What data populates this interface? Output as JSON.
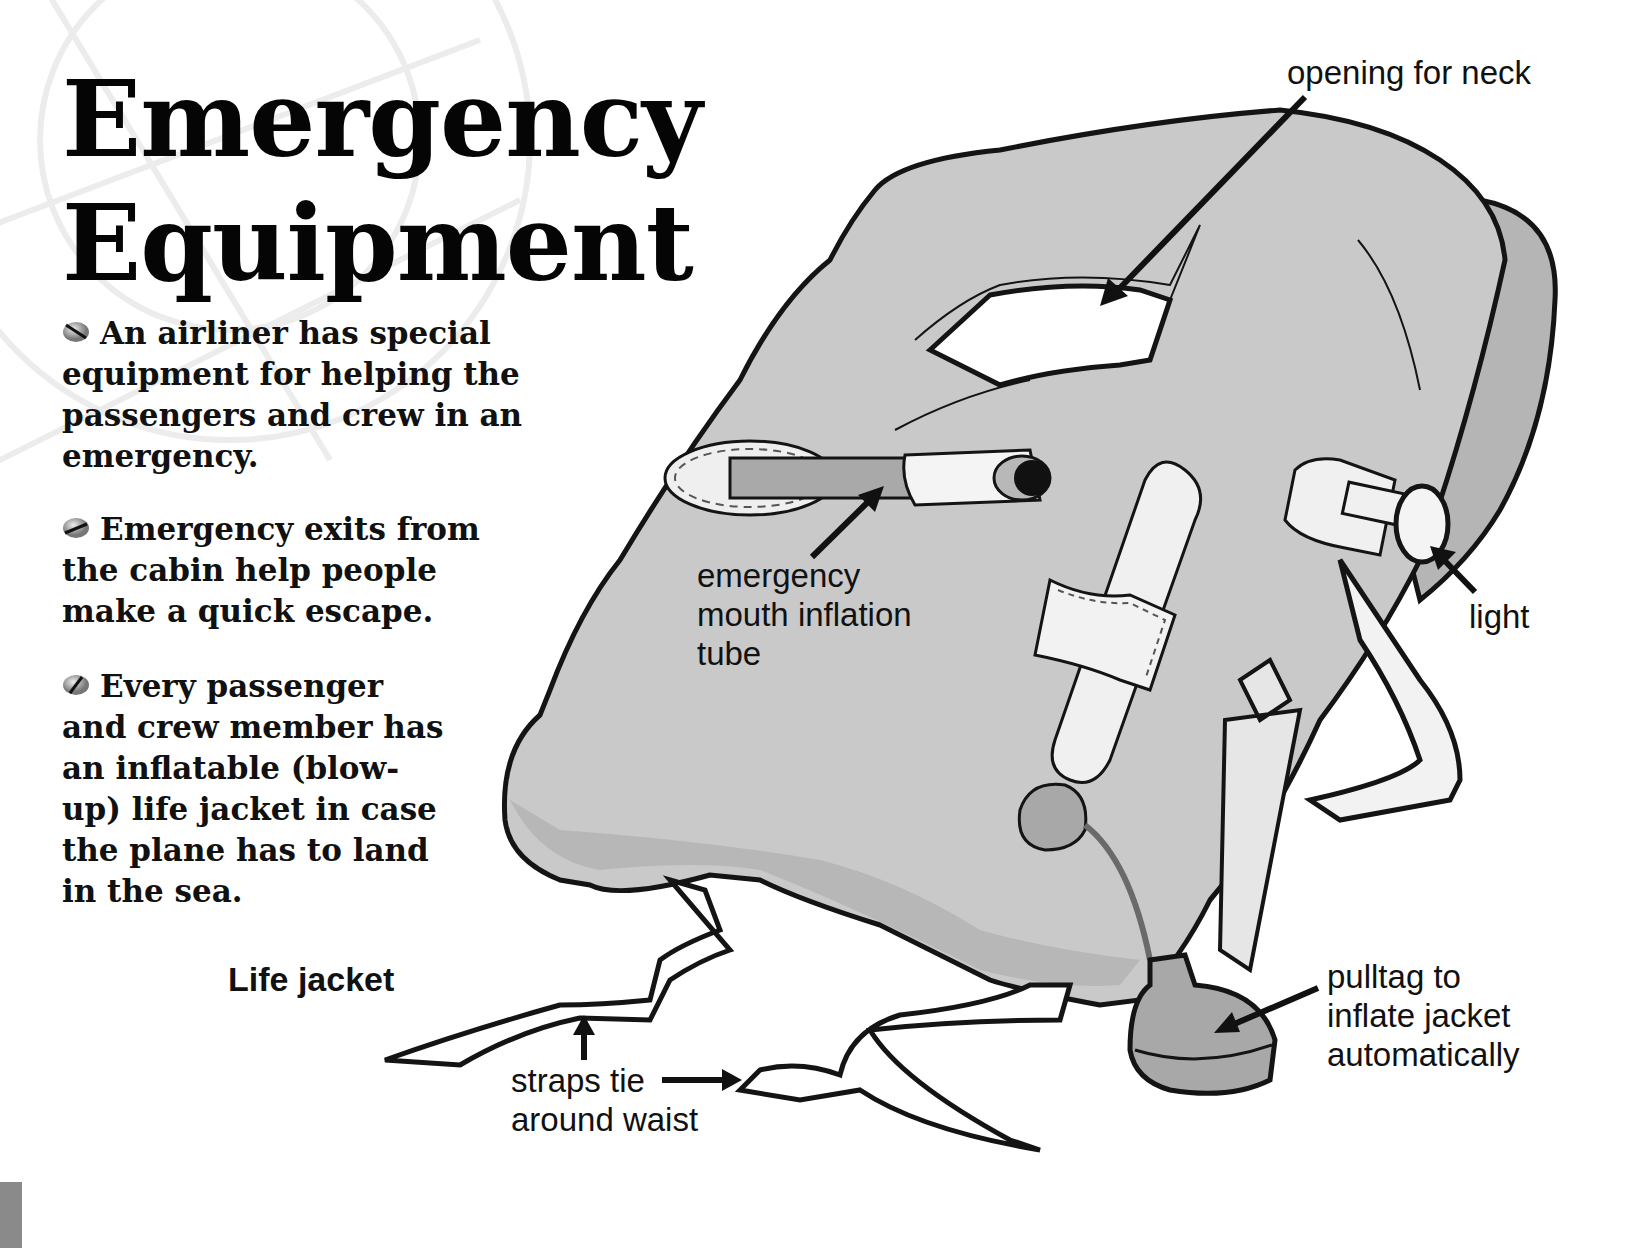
{
  "page": {
    "title_lines": [
      "Emergency",
      "Equipment"
    ],
    "paragraphs": [
      {
        "bullet_icon": "grey-ball-bullet-icon",
        "lines": [
          "An airliner has special",
          "equipment for helping the",
          "passengers and crew in an",
          "emergency."
        ]
      },
      {
        "bullet_icon": "grey-ball-bullet-icon",
        "lines": [
          "Emergency exits from",
          "the cabin help people",
          "make a quick escape."
        ]
      },
      {
        "bullet_icon": "grey-ball-bullet-icon",
        "lines": [
          "Every passenger",
          "and crew member has",
          "an inflatable (blow-",
          "up) life jacket in case",
          "the plane has to land",
          "in the sea."
        ]
      }
    ],
    "figure_caption": "Life jacket"
  },
  "diagram": {
    "subject": "life jacket",
    "labels": {
      "neck_opening": [
        "opening for neck"
      ],
      "mouth_tube": [
        "emergency",
        "mouth inflation",
        "tube"
      ],
      "light": [
        "light"
      ],
      "pulltag": [
        "pulltag to",
        "inflate jacket",
        "automatically"
      ],
      "straps": [
        "straps tie",
        "around waist"
      ]
    },
    "colors": {
      "jacket_fill": "#c9c9c9",
      "jacket_shadow": "#b3b3b3",
      "outline": "#141414",
      "strap_fill": "#ffffff",
      "tube_fill": "#a9a9a9",
      "pulltag_fill": "#a8a8a8",
      "watermark": "#ececec"
    }
  }
}
